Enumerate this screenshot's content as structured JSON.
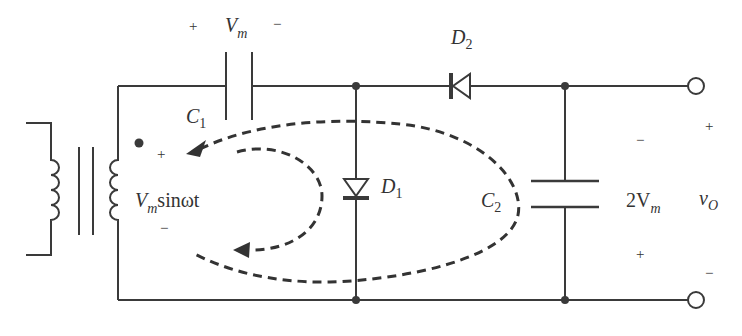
{
  "diagram": {
    "type": "circuit",
    "colors": {
      "wire": "#3a3a3a",
      "text": "#333333",
      "background": "#ffffff"
    },
    "components": {
      "transformer": {
        "source_label": "V",
        "source_sub": "m",
        "source_suffix": "sinωt",
        "plus": "+",
        "minus": "−"
      },
      "c1": {
        "name": "C",
        "sub": "1",
        "voltage": "V",
        "voltage_sub": "m",
        "plus": "+",
        "minus": "−"
      },
      "d1": {
        "name": "D",
        "sub": "1"
      },
      "d2": {
        "name": "D",
        "sub": "2"
      },
      "c2": {
        "name": "C",
        "sub": "2",
        "voltage_prefix": "2V",
        "voltage_sub": "m",
        "plus": "+",
        "minus": "−"
      },
      "output": {
        "name": "v",
        "sub": "O",
        "plus": "+",
        "minus": "−"
      }
    }
  }
}
